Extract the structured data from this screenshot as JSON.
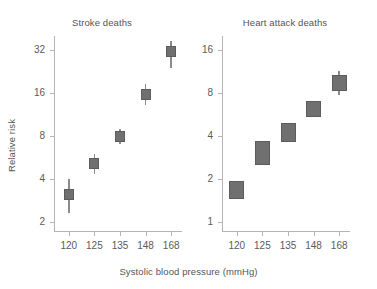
{
  "figure": {
    "xlabel": "Systolic blood pressure (mmHg)",
    "ylabel": "Relative risk",
    "marker_color": "#707070",
    "marker_border_color": "#5c5c5c",
    "whisker_color": "#8a8a8a",
    "axis_color": "#b4b4b4",
    "text_color": "#555555"
  },
  "chart_data": [
    {
      "type": "scatter",
      "title": "Stroke deaths",
      "xlabel": "Systolic blood pressure (mmHg)",
      "ylabel": "Relative risk",
      "yscale": "log2",
      "ylim": [
        1.7,
        40
      ],
      "yticks": [
        2,
        4,
        8,
        16,
        32
      ],
      "ytick_labels": [
        "2",
        "4",
        "8",
        "16",
        "32"
      ],
      "categories": [
        "120",
        "125",
        "135",
        "148",
        "168"
      ],
      "x": [
        120,
        125,
        135,
        148,
        168
      ],
      "grid": false,
      "legend": "none",
      "marker_style": "square-with-error-bars",
      "values": [
        3.1,
        5.1,
        7.9,
        15.5,
        31.0
      ],
      "ci_low": [
        2.3,
        4.3,
        7.0,
        13.2,
        24.0
      ],
      "ci_high": [
        4.0,
        6.0,
        9.0,
        18.5,
        37.0
      ],
      "points": [
        {
          "x": "120",
          "value": 3.1,
          "ci_low": 2.3,
          "ci_high": 4.0
        },
        {
          "x": "125",
          "value": 5.1,
          "ci_low": 4.3,
          "ci_high": 6.0
        },
        {
          "x": "135",
          "value": 7.9,
          "ci_low": 7.0,
          "ci_high": 9.0
        },
        {
          "x": "148",
          "value": 15.5,
          "ci_low": 13.2,
          "ci_high": 18.5
        },
        {
          "x": "168",
          "value": 31.0,
          "ci_low": 24.0,
          "ci_high": 37.0
        }
      ]
    },
    {
      "type": "scatter",
      "title": "Heart attack deaths",
      "xlabel": "Systolic blood pressure (mmHg)",
      "ylabel": "Relative risk",
      "yscale": "log2",
      "ylim": [
        0.85,
        20
      ],
      "yticks": [
        1,
        2,
        4,
        8,
        16
      ],
      "ytick_labels": [
        "1",
        "2",
        "4",
        "8",
        "16"
      ],
      "categories": [
        "120",
        "125",
        "135",
        "148",
        "168"
      ],
      "x": [
        120,
        125,
        135,
        148,
        168
      ],
      "grid": false,
      "legend": "none",
      "marker_style": "confidence-interval-box",
      "values": [
        1.65,
        3.1,
        4.3,
        6.3,
        9.3
      ],
      "ci_low": [
        1.45,
        2.5,
        3.6,
        5.4,
        8.2
      ],
      "ci_high": [
        1.95,
        3.7,
        4.9,
        7.0,
        10.6
      ],
      "points": [
        {
          "x": "120",
          "value": 1.65,
          "ci_low": 1.45,
          "ci_high": 1.95
        },
        {
          "x": "125",
          "value": 3.1,
          "ci_low": 2.5,
          "ci_high": 3.7
        },
        {
          "x": "135",
          "value": 4.3,
          "ci_low": 3.6,
          "ci_high": 4.9
        },
        {
          "x": "148",
          "value": 6.3,
          "ci_low": 5.4,
          "ci_high": 7.0
        },
        {
          "x": "168",
          "value": 9.3,
          "ci_low": 8.2,
          "ci_high": 10.6
        }
      ]
    }
  ]
}
